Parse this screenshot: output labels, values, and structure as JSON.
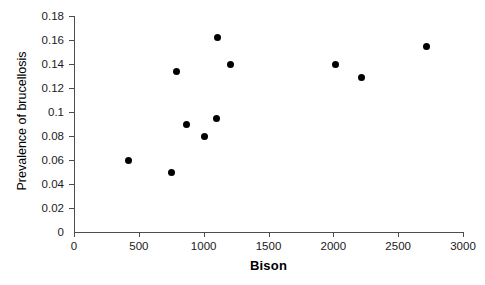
{
  "chart_data": {
    "type": "scatter",
    "title": "",
    "xlabel": "Bison",
    "ylabel": "Prevalence of brucellosis",
    "xlim": [
      0,
      3000
    ],
    "ylim": [
      0,
      0.18
    ],
    "grid": false,
    "legend": null,
    "marker": "filled-circle",
    "marker_color": "#000000",
    "xticks": [
      0,
      500,
      1000,
      1500,
      2000,
      2500,
      3000
    ],
    "xtick_labels": [
      "0",
      "500",
      "1000",
      "1500",
      "2000",
      "2500",
      "3000"
    ],
    "yticks": [
      0,
      0.02,
      0.04,
      0.06,
      0.08,
      0.1,
      0.12,
      0.14,
      0.16,
      0.18
    ],
    "ytick_labels": [
      "0",
      "0.02",
      "0.04",
      "0.06",
      "0.08",
      "0.1",
      "0.12",
      "0.14",
      "0.16",
      "0.18"
    ],
    "points": [
      {
        "x": 420,
        "y": 0.06
      },
      {
        "x": 755,
        "y": 0.05
      },
      {
        "x": 790,
        "y": 0.134
      },
      {
        "x": 870,
        "y": 0.09
      },
      {
        "x": 1010,
        "y": 0.08
      },
      {
        "x": 1100,
        "y": 0.095
      },
      {
        "x": 1110,
        "y": 0.162
      },
      {
        "x": 1205,
        "y": 0.14
      },
      {
        "x": 2020,
        "y": 0.14
      },
      {
        "x": 2215,
        "y": 0.129
      },
      {
        "x": 2720,
        "y": 0.155
      }
    ],
    "axis_color": "#4d4d4d",
    "background": "#ffffff"
  }
}
